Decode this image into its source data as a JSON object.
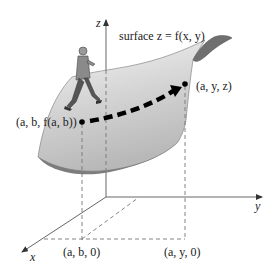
{
  "figure": {
    "surface_label": "surface z = f(x, y)",
    "axes": {
      "x_label": "x",
      "y_label": "y",
      "z_label": "z"
    },
    "points": {
      "start_point": "(a, b, f(a, b))",
      "end_point": "(a, y, z)",
      "start_projection": "(a, b, 0)",
      "end_projection": "(a, y, 0)"
    },
    "colors": {
      "surface_top_light": "#f2f2f2",
      "surface_mid": "#cfcfcf",
      "surface_underside": "#7d7d7d",
      "axis": "#555555",
      "path_arrow": "#000000",
      "text": "#222222"
    }
  }
}
